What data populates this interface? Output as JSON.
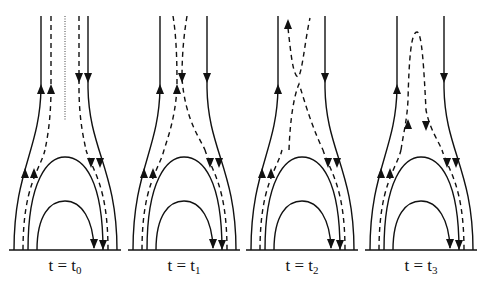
{
  "figure": {
    "stroke_color": "#111111",
    "background": "#ffffff",
    "panels": [
      {
        "label_main": "t = t",
        "label_sub": "0",
        "offset": 0,
        "dashed_state": "separate-parallel",
        "center_dotted": true
      },
      {
        "label_main": "t = t",
        "label_sub": "1",
        "offset": 119,
        "dashed_state": "converging",
        "center_dotted": false
      },
      {
        "label_main": "t = t",
        "label_sub": "2",
        "offset": 237,
        "dashed_state": "x-point",
        "center_dotted": false
      },
      {
        "label_main": "t = t",
        "label_sub": "3",
        "offset": 356,
        "dashed_state": "reconnected-loop",
        "center_dotted": false
      }
    ]
  }
}
